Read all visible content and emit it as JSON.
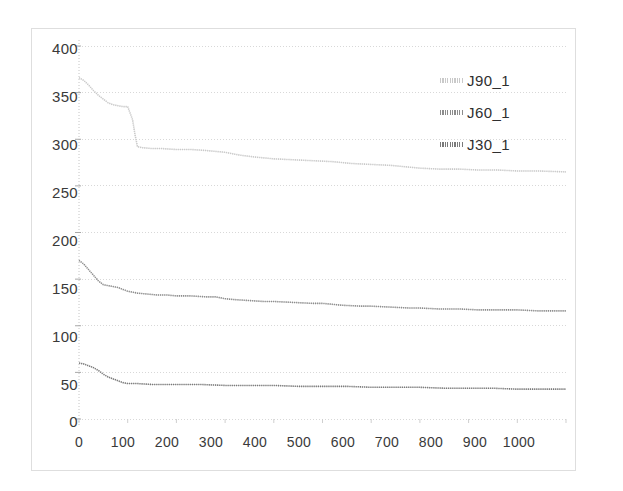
{
  "chart_data": {
    "type": "line",
    "title": "",
    "xlabel": "",
    "ylabel": "",
    "xlim": [
      0,
      1000
    ],
    "ylim": [
      0,
      400
    ],
    "xticks": [
      0,
      100,
      200,
      300,
      400,
      500,
      600,
      700,
      800,
      900,
      1000
    ],
    "yticks": [
      0,
      50,
      100,
      150,
      200,
      250,
      300,
      350,
      400
    ],
    "grid": true,
    "legend_position": "upper-right",
    "series": [
      {
        "name": "J90_1",
        "color": "#c9c9c9",
        "x": [
          0,
          10,
          20,
          30,
          40,
          50,
          60,
          70,
          80,
          90,
          100,
          110,
          115,
          120,
          130,
          150,
          170,
          200,
          230,
          260,
          280,
          300,
          330,
          360,
          400,
          440,
          480,
          520,
          560,
          600,
          640,
          680,
          700,
          740,
          780,
          820,
          860,
          900,
          940,
          1000
        ],
        "values": [
          366,
          363,
          358,
          352,
          347,
          343,
          339,
          337,
          336,
          335,
          335,
          321,
          305,
          292,
          291,
          290,
          290,
          289,
          289,
          288,
          287,
          286,
          283,
          281,
          279,
          278,
          277,
          276,
          274,
          273,
          272,
          270,
          269,
          268,
          268,
          267,
          267,
          266,
          266,
          265
        ]
      },
      {
        "name": "J60_1",
        "color": "#8c8c8c",
        "x": [
          0,
          10,
          20,
          30,
          40,
          50,
          60,
          70,
          80,
          90,
          100,
          120,
          140,
          160,
          180,
          200,
          230,
          260,
          280,
          300,
          320,
          350,
          380,
          400,
          440,
          480,
          500,
          540,
          580,
          600,
          640,
          680,
          700,
          740,
          780,
          820,
          860,
          900,
          940,
          1000
        ],
        "values": [
          170,
          166,
          160,
          154,
          148,
          144,
          143,
          142,
          141,
          139,
          137,
          135,
          134,
          133,
          133,
          132,
          132,
          131,
          131,
          129,
          128,
          127,
          126,
          126,
          125,
          124,
          124,
          122,
          121,
          121,
          120,
          119,
          119,
          118,
          118,
          117,
          117,
          117,
          116,
          116
        ]
      },
      {
        "name": "J30_1",
        "color": "#7a7a7a",
        "x": [
          0,
          10,
          20,
          30,
          40,
          50,
          60,
          70,
          80,
          90,
          100,
          120,
          150,
          200,
          250,
          300,
          350,
          400,
          450,
          500,
          550,
          600,
          650,
          700,
          750,
          800,
          850,
          900,
          950,
          1000
        ],
        "values": [
          60,
          59,
          57,
          55,
          52,
          48,
          45,
          43,
          41,
          39,
          38,
          38,
          37,
          37,
          37,
          36,
          36,
          36,
          35,
          35,
          35,
          34,
          34,
          34,
          33,
          33,
          33,
          32,
          32,
          32
        ]
      }
    ]
  },
  "legend": {
    "items": [
      {
        "label": "J90_1",
        "color": "#c9c9c9"
      },
      {
        "label": "J60_1",
        "color": "#8c8c8c"
      },
      {
        "label": "J30_1",
        "color": "#7a7a7a"
      }
    ]
  },
  "axis": {
    "y_labels": [
      "400",
      "350",
      "300",
      "250",
      "200",
      "150",
      "100",
      "50",
      "0"
    ],
    "x_labels": [
      "0",
      "100",
      "200",
      "300",
      "400",
      "500",
      "600",
      "700",
      "800",
      "900",
      "1000"
    ]
  }
}
